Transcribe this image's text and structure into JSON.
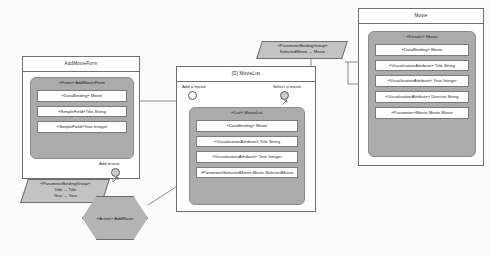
{
  "diagram": {
    "background_color": "#fbfbfb",
    "panel_fill": "#ababab",
    "note_fill": "#c3c3c3",
    "hex_fill": "#b4b4b4",
    "border_color": "#6f6f6f"
  },
  "containers": [
    {
      "id": "add-movie-form",
      "title": "AddMovieForm",
      "panel_title": "«Form» AddMovieForm",
      "rows": [
        "«DataBinding»  Movie",
        "«SimpleField»Title String",
        "«SimpleField»Year Integer"
      ],
      "event_label": "Add movie"
    },
    {
      "id": "movie-list",
      "title": "[D] MovieList",
      "panel_title": "«List» MovieList",
      "rows": [
        "«DataBinding»  Movie",
        "«VisualisationAttribute»  Title String",
        "«VisualisationAttribute»  Year Integer",
        "«ParameterSelectedMovie Movie SelectedMovie"
      ],
      "ports": [
        {
          "label": "Add a movie",
          "style": "plain"
        },
        {
          "label": "Select a movie",
          "style": "arrow"
        }
      ]
    },
    {
      "id": "movie-details",
      "title": "Movie",
      "panel_title": "«Details» Movie",
      "rows": [
        "«DataBinding»  Movie",
        "«VisualisationAttribute»  Title String",
        "«VisualisationAttribute»  Year Integer",
        "«VisualisationAttribute»  Director String",
        "«Parameter»Movie Movie Movie"
      ]
    }
  ],
  "notes": [
    {
      "id": "binding-group-selected-movie",
      "stereotype": "«ParameterBindingGroup»",
      "lines": [
        "SelectedMovie → Movie"
      ]
    },
    {
      "id": "binding-group-title-year",
      "stereotype": "«ParameterBindingGroup»",
      "lines": [
        "Title → Title",
        "Year → Year"
      ]
    }
  ],
  "action": {
    "id": "add-movie-action",
    "label": "«Action» AddMovie"
  }
}
